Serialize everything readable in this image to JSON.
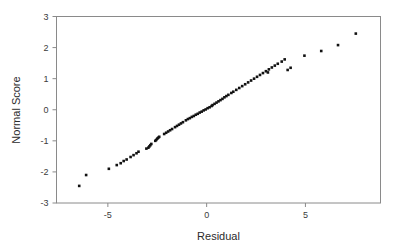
{
  "chart_data": {
    "type": "scatter",
    "title": "",
    "subtitle": "",
    "xlabel": "Residual",
    "ylabel": "Normal Score",
    "xlim": [
      -7.6,
      8.8
    ],
    "ylim": [
      -3,
      3
    ],
    "xticks": [
      -5,
      0,
      5
    ],
    "xtick_labels": [
      "-5",
      "0",
      "5"
    ],
    "yticks": [
      3,
      2,
      1,
      0,
      -1,
      -2,
      -3
    ],
    "ytick_labels": [
      "3",
      "2",
      "1",
      "0",
      "-1",
      "-2",
      "-3"
    ],
    "grid": false,
    "legend": null,
    "annotations": [],
    "marker": "square",
    "marker_color": "#121212",
    "marker_size_px": 2.6,
    "n_points": 80,
    "x": [
      -6.45,
      -6.1,
      -4.95,
      -4.55,
      -4.35,
      -4.2,
      -4.05,
      -3.85,
      -3.7,
      -3.55,
      -3.45,
      -3.05,
      -2.95,
      -2.9,
      -2.85,
      -2.8,
      -2.6,
      -2.55,
      -2.5,
      -2.45,
      -2.4,
      -2.15,
      -2.05,
      -1.95,
      -1.85,
      -1.75,
      -1.6,
      -1.5,
      -1.4,
      -1.3,
      -1.2,
      -1.05,
      -0.95,
      -0.85,
      -0.75,
      -0.65,
      -0.55,
      -0.45,
      -0.35,
      -0.25,
      -0.15,
      -0.05,
      0.05,
      0.15,
      0.25,
      0.3,
      0.4,
      0.5,
      0.6,
      0.7,
      0.8,
      0.9,
      1.0,
      1.1,
      1.25,
      1.35,
      1.5,
      1.65,
      1.8,
      1.95,
      2.1,
      2.25,
      2.4,
      2.55,
      2.7,
      2.85,
      3.0,
      3.15,
      3.3,
      3.45,
      3.6,
      3.8,
      3.95,
      4.1,
      4.25,
      4.95,
      5.8,
      6.65,
      7.55,
      3.1
    ],
    "y": [
      -2.45,
      -2.1,
      -1.9,
      -1.78,
      -1.72,
      -1.65,
      -1.6,
      -1.52,
      -1.46,
      -1.4,
      -1.35,
      -1.25,
      -1.22,
      -1.18,
      -1.14,
      -1.1,
      -1.0,
      -0.97,
      -0.93,
      -0.9,
      -0.87,
      -0.78,
      -0.74,
      -0.7,
      -0.66,
      -0.62,
      -0.56,
      -0.52,
      -0.48,
      -0.44,
      -0.4,
      -0.34,
      -0.3,
      -0.27,
      -0.23,
      -0.2,
      -0.16,
      -0.13,
      -0.09,
      -0.06,
      -0.02,
      0.01,
      0.05,
      0.08,
      0.12,
      0.15,
      0.19,
      0.23,
      0.27,
      0.31,
      0.35,
      0.4,
      0.44,
      0.48,
      0.54,
      0.58,
      0.64,
      0.7,
      0.76,
      0.82,
      0.88,
      0.94,
      1.0,
      1.06,
      1.12,
      1.18,
      1.24,
      1.3,
      1.36,
      1.42,
      1.48,
      1.55,
      1.62,
      1.28,
      1.35,
      1.74,
      1.89,
      2.08,
      2.45,
      1.2
    ]
  },
  "axes": {
    "x_title": "Residual",
    "y_title": "Normal Score"
  }
}
